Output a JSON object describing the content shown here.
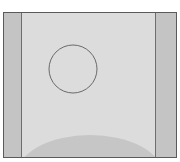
{
  "diagram": {
    "colors": {
      "background": "#dcdcdc",
      "side_strip": "#c4c4c4",
      "frame_border": "#5a5a5a",
      "circle_stroke": "#6a6a6a",
      "dome_fill": "#c6c6c6"
    },
    "shapes": [
      {
        "type": "rect",
        "role": "outer-frame"
      },
      {
        "type": "rect",
        "role": "left-strip"
      },
      {
        "type": "rect",
        "role": "right-strip"
      },
      {
        "type": "circle",
        "role": "outline-circle",
        "cx": 69,
        "cy": 56,
        "r": 24
      },
      {
        "type": "ellipse",
        "role": "bottom-dome",
        "cx": 86,
        "cy": 160,
        "rx": 72,
        "ry": 38
      }
    ]
  }
}
